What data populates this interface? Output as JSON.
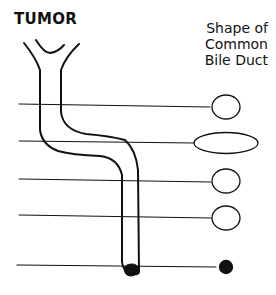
{
  "title": "TUMOR",
  "shape_label": [
    "Shape of",
    "Common",
    "Bile Duct"
  ],
  "levels": [
    {
      "y": 105,
      "shape": "round-open"
    },
    {
      "y": 141,
      "shape": "flattened-oval"
    },
    {
      "y": 180,
      "shape": "round-open"
    },
    {
      "y": 216,
      "shape": "round-open"
    },
    {
      "y": 265,
      "shape": "filled-dot"
    }
  ],
  "colors": {
    "ink": "#111111",
    "background": "#ffffff"
  }
}
